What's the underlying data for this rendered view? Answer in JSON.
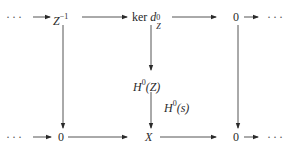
{
  "diagram": {
    "type": "commutative-diagram",
    "rows": 3,
    "columns": 3,
    "top_row": {
      "left_ellipsis": "···",
      "col1": {
        "base": "Z",
        "sup": "−1"
      },
      "col2": {
        "prefix": "ker ",
        "base": "d",
        "sup": "0",
        "sub": "Z"
      },
      "col3": "0",
      "right_ellipsis": "···"
    },
    "middle_row": {
      "col2": {
        "base": "H",
        "sup": "0",
        "arg": "(Z)"
      }
    },
    "bottom_row": {
      "left_ellipsis": "···",
      "col1": "0",
      "col2": "X",
      "col3": "0",
      "right_ellipsis": "···"
    },
    "arrow_labels": {
      "h0s": {
        "base": "H",
        "sup": "0",
        "arg": "(s)"
      }
    },
    "colors": {
      "ink": "#2a2a2a",
      "background": "#ffffff"
    }
  }
}
